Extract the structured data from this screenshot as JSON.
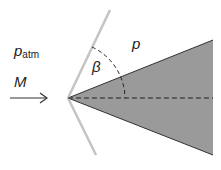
{
  "diagram": {
    "labels": {
      "ambient_pressure": "p",
      "ambient_pressure_sub": "atm",
      "mach": "M",
      "shock_angle": "β",
      "post_shock_pressure": "p"
    },
    "colors": {
      "wedge_fill": "#9a9a9a",
      "wedge_edge": "#333333",
      "shock_line": "#c4c4c4",
      "dashed": "#222222",
      "text": "#222222"
    }
  }
}
